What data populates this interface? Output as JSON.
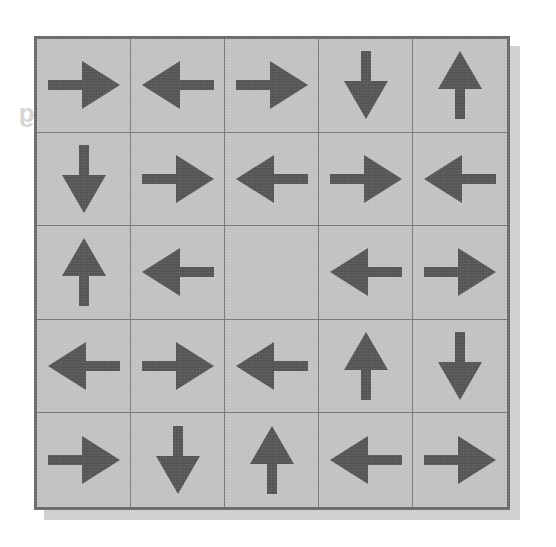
{
  "page": {
    "background_color": "#ffffff",
    "grid_background_color": "#c3c3c3",
    "arrow_color": "#555555",
    "border_color": "#6b6b6b",
    "gridline_color": "#7a7a7a"
  },
  "showthrough_text": {
    "line1": "What does/would the  exciting",
    "line2": "Answer sheet  for",
    "line3": "direction"
  },
  "grid": {
    "rows": 5,
    "columns": 5,
    "cells": [
      {
        "row": 1,
        "col": 1,
        "direction": "right"
      },
      {
        "row": 1,
        "col": 2,
        "direction": "left"
      },
      {
        "row": 1,
        "col": 3,
        "direction": "right"
      },
      {
        "row": 1,
        "col": 4,
        "direction": "down"
      },
      {
        "row": 1,
        "col": 5,
        "direction": "up"
      },
      {
        "row": 2,
        "col": 1,
        "direction": "down"
      },
      {
        "row": 2,
        "col": 2,
        "direction": "right"
      },
      {
        "row": 2,
        "col": 3,
        "direction": "left"
      },
      {
        "row": 2,
        "col": 4,
        "direction": "right"
      },
      {
        "row": 2,
        "col": 5,
        "direction": "left"
      },
      {
        "row": 3,
        "col": 1,
        "direction": "up"
      },
      {
        "row": 3,
        "col": 2,
        "direction": "left"
      },
      {
        "row": 3,
        "col": 3,
        "direction": "empty"
      },
      {
        "row": 3,
        "col": 4,
        "direction": "left"
      },
      {
        "row": 3,
        "col": 5,
        "direction": "right"
      },
      {
        "row": 4,
        "col": 1,
        "direction": "left"
      },
      {
        "row": 4,
        "col": 2,
        "direction": "right"
      },
      {
        "row": 4,
        "col": 3,
        "direction": "left"
      },
      {
        "row": 4,
        "col": 4,
        "direction": "up"
      },
      {
        "row": 4,
        "col": 5,
        "direction": "down"
      },
      {
        "row": 5,
        "col": 1,
        "direction": "right"
      },
      {
        "row": 5,
        "col": 2,
        "direction": "down"
      },
      {
        "row": 5,
        "col": 3,
        "direction": "up"
      },
      {
        "row": 5,
        "col": 4,
        "direction": "left"
      },
      {
        "row": 5,
        "col": 5,
        "direction": "right"
      }
    ]
  }
}
